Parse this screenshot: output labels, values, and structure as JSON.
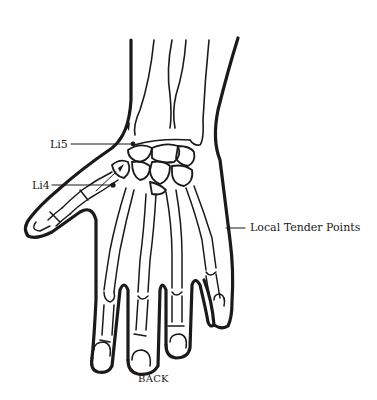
{
  "diagram": {
    "caption": "BACK",
    "labels": [
      {
        "id": "li5",
        "text": "Li5"
      },
      {
        "id": "li4",
        "text": "Li4"
      },
      {
        "id": "tender",
        "text": "Local Tender Points"
      }
    ],
    "colors": {
      "ink": "#1a1a1a",
      "background": "#ffffff"
    }
  }
}
